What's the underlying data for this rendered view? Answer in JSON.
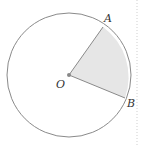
{
  "diagram": {
    "type": "circle-sector",
    "center": {
      "label": "O",
      "x": 69,
      "y": 75
    },
    "radius": 62,
    "points": [
      {
        "label": "A",
        "x": 103,
        "y": 27
      },
      {
        "label": "B",
        "x": 125,
        "y": 98
      }
    ],
    "sector_fill": "#e6e6e6",
    "stroke": "#888888"
  },
  "labels": {
    "O": "O",
    "A": "A",
    "B": "B"
  }
}
